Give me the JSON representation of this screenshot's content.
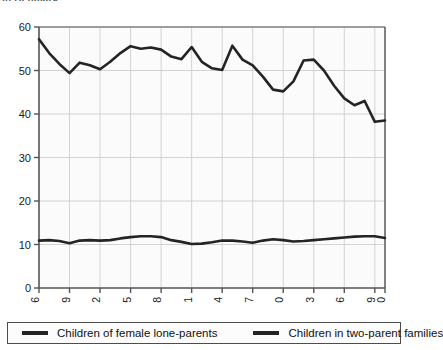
{
  "clipped_title": "in Denmark",
  "chart_data": {
    "type": "line",
    "title": "",
    "xlabel": "",
    "ylabel": "",
    "x": [
      1976,
      1977,
      1978,
      1979,
      1980,
      1981,
      1982,
      1983,
      1984,
      1985,
      1986,
      1987,
      1988,
      1989,
      1990,
      1991,
      1992,
      1993,
      1994,
      1995,
      1996,
      1997,
      1998,
      1999,
      2000,
      2001,
      2002,
      2003,
      2004,
      2005,
      2006,
      2007,
      2008,
      2009,
      2010
    ],
    "xlim": [
      1976,
      2010
    ],
    "ylim": [
      0,
      60
    ],
    "yticks": [
      0,
      10,
      20,
      30,
      40,
      50,
      60
    ],
    "xticks": [
      1976,
      1979,
      1982,
      1985,
      1988,
      1991,
      1994,
      1997,
      2000,
      2003,
      2006,
      2009,
      2010
    ],
    "xtick_labels": [
      "1976",
      "1979",
      "1982",
      "1985",
      "1988",
      "1991",
      "1994",
      "1997",
      "2000",
      "2003",
      "2006",
      "2009",
      "2010"
    ],
    "ytick_labels": [
      "0",
      "10",
      "20",
      "30",
      "40",
      "50",
      "60"
    ],
    "grid": true,
    "legend_position": "bottom",
    "series": [
      {
        "name": "Children of female lone-parents",
        "color": "#242424",
        "values": [
          57.2,
          54.0,
          51.5,
          49.4,
          51.8,
          51.2,
          50.3,
          52.0,
          54.0,
          55.6,
          55.0,
          55.3,
          54.8,
          53.2,
          52.6,
          55.4,
          52.0,
          50.5,
          50.1,
          55.7,
          52.5,
          51.2,
          48.6,
          45.6,
          45.2,
          47.5,
          52.3,
          52.5,
          50.0,
          46.5,
          43.6,
          42.0,
          43.0,
          38.2,
          38.5
        ]
      },
      {
        "name": "Children in two-parent families",
        "color": "#242424",
        "values": [
          10.9,
          11.0,
          10.8,
          10.3,
          10.9,
          11.0,
          10.9,
          11.0,
          11.4,
          11.7,
          11.9,
          11.9,
          11.7,
          11.0,
          10.6,
          10.1,
          10.2,
          10.5,
          10.9,
          10.9,
          10.7,
          10.4,
          10.9,
          11.2,
          11.0,
          10.7,
          10.8,
          11.0,
          11.2,
          11.4,
          11.6,
          11.8,
          11.9,
          11.9,
          11.5
        ]
      }
    ]
  },
  "legend": {
    "entries": [
      {
        "label": "Children of female lone-parents"
      },
      {
        "label": "Children in two-parent families"
      }
    ]
  }
}
